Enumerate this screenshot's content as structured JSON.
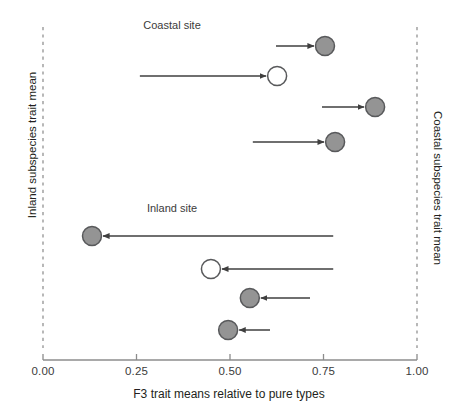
{
  "figure": {
    "background_color": "#ffffff",
    "axis_color": "#8c8c8c",
    "text_color": "#231f20",
    "marker_gray_fill": "#949494",
    "marker_white_fill": "#ffffff",
    "marker_stroke": "#58595b",
    "arrow_color": "#3f3f3f",
    "dashed_line_color": "#9a9a9a"
  },
  "chart_data": {
    "type": "scatter",
    "title": "",
    "xlabel": "F3 trait means relative to pure types",
    "ylabel": "",
    "left_axis_label": "Inland subspecies trait mean",
    "right_axis_label": "Coastal subspecies trait mean",
    "xlim": [
      0.0,
      1.0
    ],
    "xticks": [
      0.0,
      0.25,
      0.5,
      0.75,
      1.0
    ],
    "xticklabels": [
      "0.00",
      "0.25",
      "0.50",
      "0.75",
      "1.00"
    ],
    "grid": false,
    "legend": null,
    "reference_lines": [
      {
        "name": "inland-pure-type",
        "x": 0.0,
        "style": "dashed"
      },
      {
        "name": "coastal-pure-type",
        "x": 1.0,
        "style": "dashed"
      }
    ],
    "panels": [
      {
        "name": "coastal-site",
        "label": "Coastal site",
        "label_x": 0.345,
        "points": [
          {
            "row": 1,
            "x": 0.754,
            "marker": "filled",
            "arrow_from": 0.623,
            "arrow_to": 0.754,
            "direction": "right"
          },
          {
            "row": 2,
            "x": 0.626,
            "marker": "open",
            "arrow_from": 0.259,
            "arrow_to": 0.626,
            "direction": "right"
          },
          {
            "row": 3,
            "x": 0.888,
            "marker": "filled",
            "arrow_from": 0.746,
            "arrow_to": 0.888,
            "direction": "right"
          },
          {
            "row": 4,
            "x": 0.781,
            "marker": "filled",
            "arrow_from": 0.561,
            "arrow_to": 0.781,
            "direction": "right"
          }
        ]
      },
      {
        "name": "inland-site",
        "label": "Inland site",
        "label_x": 0.345,
        "points": [
          {
            "row": 1,
            "x": 0.131,
            "marker": "filled",
            "arrow_from": 0.776,
            "arrow_to": 0.131,
            "direction": "left"
          },
          {
            "row": 2,
            "x": 0.449,
            "marker": "open",
            "arrow_from": 0.776,
            "arrow_to": 0.449,
            "direction": "left"
          },
          {
            "row": 3,
            "x": 0.553,
            "marker": "filled",
            "arrow_from": 0.714,
            "arrow_to": 0.553,
            "direction": "left"
          },
          {
            "row": 4,
            "x": 0.495,
            "marker": "filled",
            "arrow_from": 0.607,
            "arrow_to": 0.495,
            "direction": "left"
          }
        ]
      }
    ]
  },
  "axis": {
    "ticks": [
      {
        "label": "0.00",
        "x": 0.0
      },
      {
        "label": "0.25",
        "x": 0.25
      },
      {
        "label": "0.50",
        "x": 0.5
      },
      {
        "label": "0.75",
        "x": 0.75
      },
      {
        "label": "1.00",
        "x": 1.0
      }
    ],
    "title": "F3 trait means relative to pure types"
  },
  "labels": {
    "coastal_site": "Coastal site",
    "inland_site": "Inland site",
    "left_axis": "Inland subspecies trait mean",
    "right_axis": "Coastal subspecies trait mean"
  }
}
